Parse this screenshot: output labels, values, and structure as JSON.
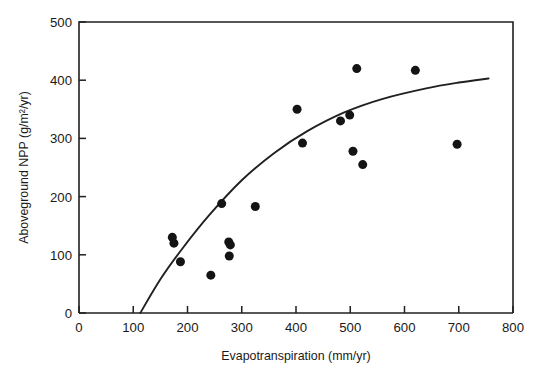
{
  "chart_data": {
    "type": "scatter",
    "title": "",
    "subtitle": "",
    "xlabel": "Evapotranspiration (mm/yr)",
    "ylabel": "Aboveground NPP (g/m²/yr)",
    "xlim": [
      0,
      800
    ],
    "ylim": [
      0,
      500
    ],
    "xticks": [
      0,
      100,
      200,
      300,
      400,
      500,
      600,
      700,
      800
    ],
    "yticks": [
      0,
      100,
      200,
      300,
      400,
      500
    ],
    "xticklabels": [
      "0",
      "100",
      "200",
      "300",
      "400",
      "500",
      "600",
      "700",
      "800"
    ],
    "yticklabels": [
      "0",
      "100",
      "200",
      "300",
      "400",
      "500"
    ],
    "grid": false,
    "legend": null,
    "legend_position": "none",
    "annotations": [],
    "marker": {
      "shape": "circle",
      "color": "#141414",
      "size_px": 9
    },
    "series": [
      {
        "name": "Aboveground NPP vs Evapotranspiration",
        "type": "scatter",
        "points": [
          {
            "x": 172,
            "y": 130
          },
          {
            "x": 175,
            "y": 120
          },
          {
            "x": 187,
            "y": 88
          },
          {
            "x": 243,
            "y": 65
          },
          {
            "x": 263,
            "y": 188
          },
          {
            "x": 276,
            "y": 122
          },
          {
            "x": 279,
            "y": 117
          },
          {
            "x": 277,
            "y": 98
          },
          {
            "x": 325,
            "y": 183
          },
          {
            "x": 402,
            "y": 350
          },
          {
            "x": 412,
            "y": 292
          },
          {
            "x": 482,
            "y": 330
          },
          {
            "x": 499,
            "y": 340
          },
          {
            "x": 512,
            "y": 420
          },
          {
            "x": 505,
            "y": 278
          },
          {
            "x": 523,
            "y": 255
          },
          {
            "x": 620,
            "y": 417
          },
          {
            "x": 697,
            "y": 290
          }
        ]
      }
    ],
    "fit_curve": {
      "name": "fitted saturating curve",
      "type": "line",
      "points": [
        {
          "x": 113,
          "y": 0
        },
        {
          "x": 150,
          "y": 58
        },
        {
          "x": 190,
          "y": 110
        },
        {
          "x": 240,
          "y": 168
        },
        {
          "x": 300,
          "y": 228
        },
        {
          "x": 360,
          "y": 275
        },
        {
          "x": 420,
          "y": 312
        },
        {
          "x": 490,
          "y": 345
        },
        {
          "x": 560,
          "y": 368
        },
        {
          "x": 640,
          "y": 386
        },
        {
          "x": 700,
          "y": 396
        },
        {
          "x": 755,
          "y": 403
        }
      ]
    }
  },
  "figure": {
    "background_color": "#ffffff",
    "axis_color": "#221f1f"
  }
}
